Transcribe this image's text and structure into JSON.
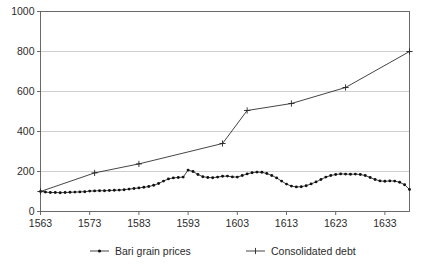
{
  "chart_data": {
    "type": "line",
    "title": "",
    "xlabel": "",
    "ylabel": "",
    "xlim": [
      1563,
      1638
    ],
    "ylim": [
      0,
      1000
    ],
    "grid": true,
    "legend_position": "bottom",
    "y_ticks": [
      0,
      200,
      400,
      600,
      800,
      1000
    ],
    "y_tick_labels": [
      "0",
      "200",
      "400",
      "600",
      "800",
      "1000"
    ],
    "x_ticks": [
      1563,
      1573,
      1583,
      1593,
      1603,
      1613,
      1623,
      1633
    ],
    "x_tick_labels": [
      "1563",
      "1573",
      "1583",
      "1593",
      "1603",
      "1613",
      "1623",
      "1633"
    ],
    "series": [
      {
        "name": "Bari grain prices",
        "marker": "dot",
        "color": "#242424",
        "x": [
          1563,
          1564,
          1565,
          1566,
          1567,
          1568,
          1569,
          1570,
          1571,
          1572,
          1573,
          1574,
          1575,
          1576,
          1577,
          1578,
          1579,
          1580,
          1581,
          1582,
          1583,
          1584,
          1585,
          1586,
          1587,
          1588,
          1589,
          1590,
          1591,
          1592,
          1593,
          1594,
          1595,
          1596,
          1597,
          1598,
          1599,
          1600,
          1601,
          1602,
          1603,
          1604,
          1605,
          1606,
          1607,
          1608,
          1609,
          1610,
          1611,
          1612,
          1613,
          1614,
          1615,
          1616,
          1617,
          1618,
          1619,
          1620,
          1621,
          1622,
          1623,
          1624,
          1625,
          1626,
          1627,
          1628,
          1629,
          1630,
          1631,
          1632,
          1633,
          1634,
          1635,
          1636,
          1637,
          1638
        ],
        "values": [
          100,
          97,
          95,
          95,
          94,
          95,
          96,
          97,
          98,
          99,
          102,
          103,
          104,
          104,
          105,
          106,
          107,
          109,
          112,
          115,
          118,
          121,
          125,
          131,
          140,
          152,
          163,
          168,
          170,
          172,
          207,
          200,
          185,
          174,
          170,
          169,
          172,
          176,
          177,
          173,
          172,
          180,
          188,
          194,
          197,
          196,
          190,
          180,
          168,
          152,
          137,
          127,
          123,
          124,
          129,
          138,
          148,
          160,
          172,
          180,
          185,
          188,
          187,
          186,
          187,
          185,
          180,
          170,
          160,
          153,
          151,
          153,
          152,
          146,
          134,
          110
        ]
      },
      {
        "name": "Consolidated debt",
        "marker": "plus",
        "color": "#242424",
        "x": [
          1563,
          1574,
          1583,
          1600,
          1605,
          1614,
          1625,
          1638
        ],
        "values": [
          100,
          193,
          238,
          340,
          505,
          540,
          620,
          800
        ]
      }
    ]
  },
  "legend": {
    "items": [
      {
        "label": "Bari grain prices",
        "marker": "dot"
      },
      {
        "label": "Consolidated debt",
        "marker": "plus"
      }
    ]
  }
}
